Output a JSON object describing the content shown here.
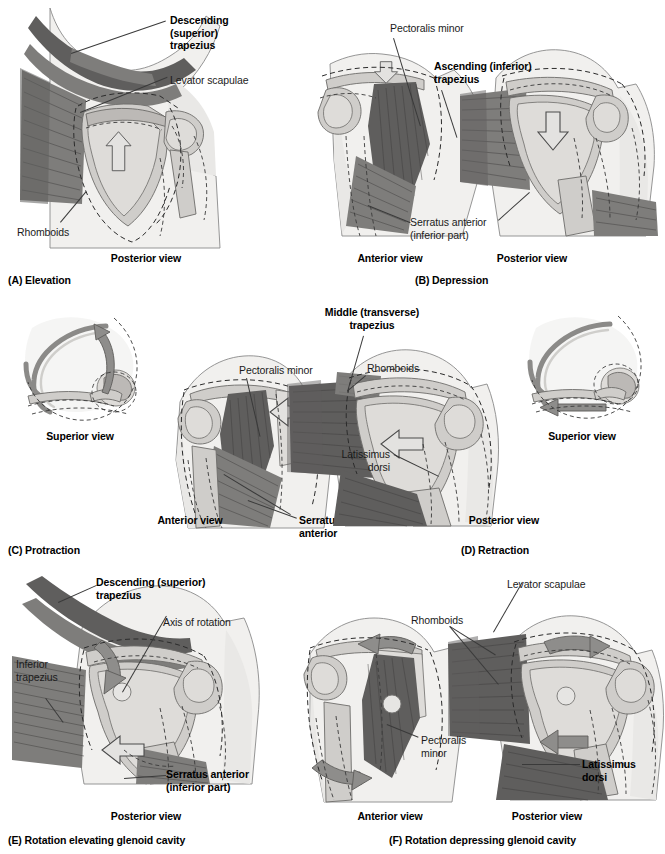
{
  "figure": {
    "background": "#ffffff",
    "ink": "#1b1b1b"
  },
  "panels": [
    {
      "id": "A",
      "caption": "(A) Elevation",
      "views": [
        {
          "name": "posterior-view",
          "label": "Posterior view"
        }
      ],
      "labels": [
        {
          "name": "descending-superior-trapezius",
          "text": "Descending\n(superior)\ntrapezius",
          "bold": true
        },
        {
          "name": "levator-scapulae",
          "text": "Levator scapulae",
          "bold": false
        },
        {
          "name": "rhomboids",
          "text": "Rhomboids",
          "bold": false
        }
      ],
      "arrows": [
        {
          "name": "elevation-arrow",
          "direction": "up",
          "style": "hollow"
        }
      ]
    },
    {
      "id": "B",
      "caption": "(B) Depression",
      "views": [
        {
          "name": "anterior-view",
          "label": "Anterior view"
        },
        {
          "name": "posterior-view",
          "label": "Posterior view"
        }
      ],
      "labels": [
        {
          "name": "pectoralis-minor",
          "text": "Pectoralis minor",
          "bold": false
        },
        {
          "name": "ascending-inferior-trapezius",
          "text": "Ascending (inferior)\ntrapezius",
          "bold": true
        },
        {
          "name": "serratus-anterior-inferior-part",
          "text": "Serratus anterior\n(inferior part)",
          "bold": false
        }
      ],
      "arrows": [
        {
          "name": "depression-arrow-anterior",
          "direction": "down",
          "style": "hollow"
        },
        {
          "name": "depression-arrow-posterior",
          "direction": "down",
          "style": "hollow"
        }
      ]
    },
    {
      "id": "C",
      "caption": "(C) Protraction",
      "views": [
        {
          "name": "superior-view",
          "label": "Superior view"
        },
        {
          "name": "anterior-view",
          "label": "Anterior view"
        }
      ],
      "labels": [
        {
          "name": "pectoralis-minor",
          "text": "Pectoralis minor",
          "bold": false
        },
        {
          "name": "serratus-anterior",
          "text": "Serratus\nanterior",
          "bold": true
        }
      ],
      "arrows": [
        {
          "name": "protraction-curved-arrow",
          "direction": "curved-forward",
          "style": "solid"
        },
        {
          "name": "protraction-arrow-anterior",
          "direction": "left",
          "style": "hollow"
        }
      ]
    },
    {
      "id": "D",
      "caption": "(D) Retraction",
      "views": [
        {
          "name": "posterior-view",
          "label": "Posterior view"
        },
        {
          "name": "superior-view",
          "label": "Superior view"
        }
      ],
      "labels": [
        {
          "name": "middle-transverse-trapezius",
          "text": "Middle (transverse)\ntrapezius",
          "bold": true
        },
        {
          "name": "rhomboids",
          "text": "Rhomboids",
          "bold": false
        },
        {
          "name": "latissimus-dorsi",
          "text": "Latissimus\ndorsi",
          "bold": false
        }
      ],
      "arrows": [
        {
          "name": "retraction-arrow-posterior",
          "direction": "left",
          "style": "hollow"
        },
        {
          "name": "retraction-straight-arrow",
          "direction": "left",
          "style": "solid"
        }
      ]
    },
    {
      "id": "E",
      "caption": "(E) Rotation elevating glenoid cavity",
      "views": [
        {
          "name": "posterior-view",
          "label": "Posterior view"
        }
      ],
      "labels": [
        {
          "name": "descending-superior-trapezius",
          "text": "Descending (superior)\ntrapezius",
          "bold": true
        },
        {
          "name": "axis-of-rotation",
          "text": "Axis of rotation",
          "bold": false
        },
        {
          "name": "inferior-trapezius",
          "text": "Inferior\ntrapezius",
          "bold": false
        },
        {
          "name": "serratus-anterior-inferior-part",
          "text": "Serratus anterior\n(inferior part)",
          "bold": true
        }
      ],
      "arrows": [
        {
          "name": "rotation-arrow-upper",
          "direction": "curved-down-left",
          "style": "solid"
        },
        {
          "name": "rotation-arrow-lower",
          "direction": "curved-left",
          "style": "hollow"
        }
      ]
    },
    {
      "id": "F",
      "caption": "(F) Rotation depressing glenoid cavity",
      "views": [
        {
          "name": "anterior-view",
          "label": "Anterior view"
        },
        {
          "name": "posterior-view",
          "label": "Posterior view"
        }
      ],
      "labels": [
        {
          "name": "levator-scapulae",
          "text": "Levator scapulae",
          "bold": false
        },
        {
          "name": "rhomboids",
          "text": "Rhomboids",
          "bold": false
        },
        {
          "name": "pectoralis-minor",
          "text": "Pectoralis\nminor",
          "bold": false
        },
        {
          "name": "latissimus-dorsi",
          "text": "Latissimus\ndorsi",
          "bold": true
        }
      ],
      "arrows": [
        {
          "name": "rotation-arrow-anterior-upper",
          "direction": "curved-up-left",
          "style": "solid"
        },
        {
          "name": "rotation-arrow-anterior-lower",
          "direction": "curved-down-right",
          "style": "solid"
        },
        {
          "name": "rotation-arrow-posterior-upper",
          "direction": "curved-up-right",
          "style": "solid"
        },
        {
          "name": "rotation-arrow-posterior-lower",
          "direction": "curved-left",
          "style": "solid"
        }
      ]
    }
  ]
}
